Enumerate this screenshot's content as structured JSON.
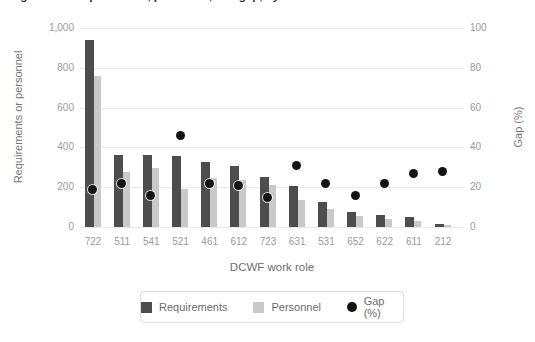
{
  "clipped_caption": "Figure 3.1. Requirements, personnel, and gap, by DCWF work role",
  "chart_data": {
    "type": "bar",
    "subtype": "grouped bars with scatter overlay on secondary axis",
    "title": "",
    "categories": [
      "722",
      "511",
      "541",
      "521",
      "461",
      "612",
      "723",
      "631",
      "531",
      "652",
      "622",
      "611",
      "212"
    ],
    "series": [
      {
        "name": "Requirements",
        "type": "bar",
        "axis": "left",
        "color": "#4d4d4d",
        "values": [
          940,
          360,
          360,
          355,
          325,
          305,
          250,
          205,
          125,
          75,
          60,
          50,
          15
        ]
      },
      {
        "name": "Personnel",
        "type": "bar",
        "axis": "left",
        "color": "#c9c9c9",
        "values": [
          760,
          275,
          295,
          190,
          245,
          235,
          210,
          135,
          90,
          55,
          40,
          30,
          8
        ]
      },
      {
        "name": "Gap (%)",
        "type": "scatter",
        "axis": "right",
        "color": "#141414",
        "values": [
          19,
          22,
          16,
          46,
          22,
          21,
          15,
          31,
          22,
          16,
          22,
          27,
          28
        ]
      }
    ],
    "xlabel": "DCWF work role",
    "ylabel_left": "Requirements or personnel",
    "ylabel_right": "Gap (%)",
    "ylim_left": [
      0,
      1000
    ],
    "ylim_right": [
      0,
      100
    ],
    "yticks_left": [
      "0",
      "200",
      "400",
      "600",
      "800",
      "1,000"
    ],
    "yticks_right": [
      "0",
      "20",
      "40",
      "60",
      "80",
      "100"
    ],
    "grid": true,
    "gridline_color": "#e9e9e9",
    "legend_position": "bottom",
    "tick_label_color": "#9b9b9b",
    "axis_title_color": "#767676"
  }
}
